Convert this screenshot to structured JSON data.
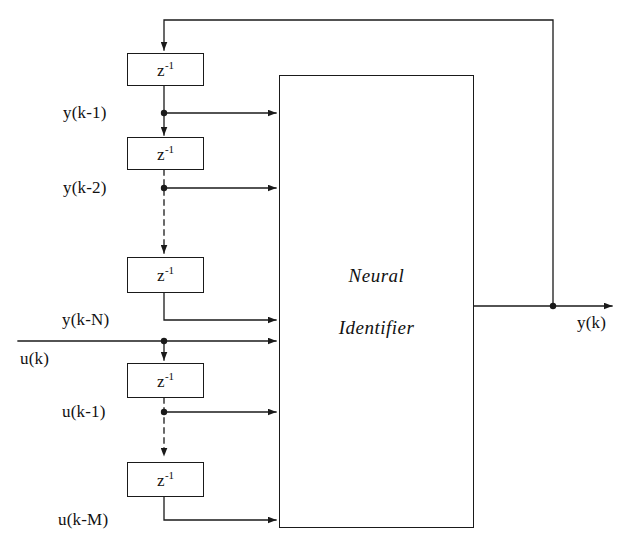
{
  "diagram": {
    "stroke_color": "#1a1a1a",
    "background_color": "#ffffff",
    "identifier_block": {
      "line1": "Neural",
      "line2": "Identifier"
    },
    "delay_blocks": [
      {
        "id": "delay-y1",
        "label_base": "z",
        "label_exp": "-1"
      },
      {
        "id": "delay-y2",
        "label_base": "z",
        "label_exp": "-1"
      },
      {
        "id": "delay-yN",
        "label_base": "z",
        "label_exp": "-1"
      },
      {
        "id": "delay-u1",
        "label_base": "z",
        "label_exp": "-1"
      },
      {
        "id": "delay-uM",
        "label_base": "z",
        "label_exp": "-1"
      }
    ],
    "signals": [
      {
        "id": "y-k-1",
        "text": "y(k-1)"
      },
      {
        "id": "y-k-2",
        "text": "y(k-2)"
      },
      {
        "id": "y-k-N",
        "text": "y(k-N)"
      },
      {
        "id": "u-k",
        "text": "u(k)"
      },
      {
        "id": "u-k-1",
        "text": "u(k-1)"
      },
      {
        "id": "u-k-M",
        "text": "u(k-M)"
      },
      {
        "id": "y-k",
        "text": "y(k)"
      }
    ]
  }
}
